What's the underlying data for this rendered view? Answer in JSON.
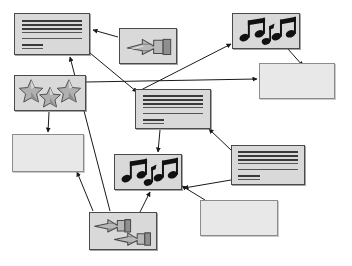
{
  "diagram": {
    "background_color": "#ffffff",
    "node_fill": "#d9d9d9",
    "node_empty_fill": "#e8e8e8",
    "node_border": "#4a4a4a",
    "edge_color": "#1a1a1a",
    "node_count": 12,
    "edge_count": 13
  },
  "nodes": [
    {
      "id": "n1",
      "name": "document-node-top-left",
      "icon": "text-lines-icon",
      "label": "",
      "x": 14,
      "y": 13,
      "w": 76,
      "h": 42
    },
    {
      "id": "n2",
      "name": "hand-node-top-center",
      "icon": "pointing-hand-icon",
      "label": "",
      "x": 119,
      "y": 28,
      "w": 58,
      "h": 36
    },
    {
      "id": "n3",
      "name": "music-node-top-right",
      "icon": "music-notes-icon",
      "label": "",
      "x": 232,
      "y": 13,
      "w": 68,
      "h": 36
    },
    {
      "id": "n4",
      "name": "empty-node-right-upper",
      "icon": "",
      "label": "",
      "x": 259,
      "y": 63,
      "w": 76,
      "h": 36
    },
    {
      "id": "n5",
      "name": "stars-node-left",
      "icon": "three-stars-icon",
      "label": "",
      "x": 14,
      "y": 75,
      "w": 72,
      "h": 36
    },
    {
      "id": "n6",
      "name": "document-node-center",
      "icon": "text-lines-icon",
      "label": "",
      "x": 135,
      "y": 89,
      "w": 76,
      "h": 40
    },
    {
      "id": "n7",
      "name": "empty-node-left-middle",
      "icon": "",
      "label": "",
      "x": 12,
      "y": 134,
      "w": 72,
      "h": 38
    },
    {
      "id": "n8",
      "name": "music-node-center-lower",
      "icon": "music-notes-icon",
      "label": "",
      "x": 114,
      "y": 154,
      "w": 68,
      "h": 36
    },
    {
      "id": "n9",
      "name": "document-node-right",
      "icon": "text-lines-icon",
      "label": "",
      "x": 231,
      "y": 145,
      "w": 74,
      "h": 40
    },
    {
      "id": "n10",
      "name": "empty-node-bottom-right",
      "icon": "",
      "label": "",
      "x": 200,
      "y": 200,
      "w": 78,
      "h": 36
    },
    {
      "id": "n11",
      "name": "hands-node-bottom-center",
      "icon": "double-pointing-hands-icon",
      "label": "",
      "x": 89,
      "y": 212,
      "w": 68,
      "h": 38
    }
  ],
  "edges": [
    {
      "name": "edge-hand-to-document-top-left",
      "from": "n2",
      "to": "n1",
      "x1": 118,
      "y1": 37,
      "x2": 93,
      "y2": 30
    },
    {
      "name": "edge-document-top-left-to-center",
      "from": "n1",
      "to": "n6",
      "x1": 90,
      "y1": 53,
      "x2": 137,
      "y2": 92
    },
    {
      "name": "edge-stars-to-empty-left",
      "from": "n5",
      "to": "n7",
      "x1": 49,
      "y1": 112,
      "x2": 48,
      "y2": 132
    },
    {
      "name": "edge-stars-to-empty-right-upper",
      "from": "n5",
      "to": "n4",
      "x1": 86,
      "y1": 82,
      "x2": 257,
      "y2": 79
    },
    {
      "name": "edge-center-to-music-top-right",
      "from": "n6",
      "to": "n3",
      "x1": 137,
      "y1": 92,
      "x2": 231,
      "y2": 44
    },
    {
      "name": "edge-music-top-to-empty-right",
      "from": "n3",
      "to": "n4",
      "x1": 288,
      "y1": 49,
      "x2": 303,
      "y2": 66
    },
    {
      "name": "edge-center-to-music-lower",
      "from": "n6",
      "to": "n8",
      "x1": 160,
      "y1": 130,
      "x2": 158,
      "y2": 152
    },
    {
      "name": "edge-document-right-to-center",
      "from": "n9",
      "to": "n6",
      "x1": 231,
      "y1": 150,
      "x2": 209,
      "y2": 129
    },
    {
      "name": "edge-document-right-to-music",
      "from": "n9",
      "to": "n8",
      "x1": 231,
      "y1": 180,
      "x2": 184,
      "y2": 188
    },
    {
      "name": "edge-hands-to-document-top-left",
      "from": "n11",
      "to": "n1",
      "x1": 110,
      "y1": 211,
      "x2": 70,
      "y2": 57
    },
    {
      "name": "edge-hands-to-empty-left-middle",
      "from": "n11",
      "to": "n7",
      "x1": 93,
      "y1": 211,
      "x2": 77,
      "y2": 172
    },
    {
      "name": "edge-empty-bottom-right-to-music",
      "from": "n10",
      "to": "n8",
      "x1": 205,
      "y1": 200,
      "x2": 182,
      "y2": 186
    },
    {
      "name": "edge-hands-to-music-lower",
      "from": "n11",
      "to": "n8",
      "x1": 140,
      "y1": 212,
      "x2": 150,
      "y2": 192
    }
  ]
}
